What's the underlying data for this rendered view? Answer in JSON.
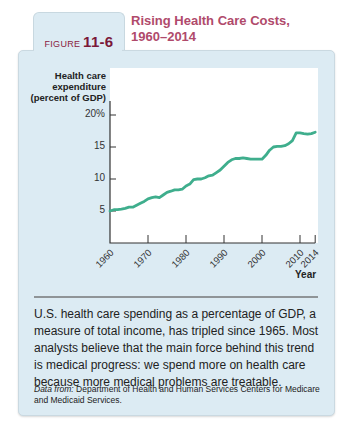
{
  "figure": {
    "tab_prefix": "FIGURE",
    "tab_number": "11-6",
    "title_line1": "Rising Health Care Costs,",
    "title_line2": "1960–2014"
  },
  "caption": "U.S. health care spending as a percentage of GDP, a measure of total income, has tripled since 1965. Most analysts believe that the main force behind this trend is medical progress: we spend more on health care because more medical problems are treatable.",
  "source": {
    "label": "Data from:",
    "text": "Department of Health and Human Services Centers for Medicare and Medicaid Services."
  },
  "colors": {
    "line": "#3fae8d",
    "title": "#b04a6b",
    "panel": "#dcebf3"
  },
  "chart_data": {
    "type": "line",
    "title": "Rising Health Care Costs, 1960–2014",
    "ylabel": "Health care expenditure (percent of GDP)",
    "ylabel_lines": [
      "Health care",
      "expenditure",
      "(percent of GDP)"
    ],
    "xlabel": "Year",
    "ylim": [
      0,
      20
    ],
    "xlim": [
      1960,
      2014
    ],
    "yticks": [
      5,
      10,
      15,
      20
    ],
    "ytick_labels": [
      "5",
      "10",
      "15",
      "20%"
    ],
    "xticks": [
      1960,
      1970,
      1980,
      1990,
      2000,
      2010,
      2014
    ],
    "xtick_labels": [
      "1960",
      "1970",
      "1980",
      "1990",
      "2000",
      "2010",
      "2014"
    ],
    "grid": false,
    "legend": null,
    "series": [
      {
        "name": "Health care expenditure",
        "x": [
          1960,
          1961,
          1962,
          1963,
          1964,
          1965,
          1966,
          1967,
          1968,
          1969,
          1970,
          1971,
          1972,
          1973,
          1974,
          1975,
          1976,
          1977,
          1978,
          1979,
          1980,
          1981,
          1982,
          1983,
          1984,
          1985,
          1986,
          1987,
          1988,
          1989,
          1990,
          1991,
          1992,
          1993,
          1994,
          1995,
          1996,
          1997,
          1998,
          1999,
          2000,
          2001,
          2002,
          2003,
          2004,
          2005,
          2006,
          2007,
          2008,
          2009,
          2010,
          2011,
          2012,
          2013,
          2014
        ],
        "values": [
          5.0,
          5.2,
          5.2,
          5.3,
          5.4,
          5.6,
          5.6,
          5.9,
          6.2,
          6.5,
          6.9,
          7.1,
          7.2,
          7.1,
          7.5,
          7.9,
          8.1,
          8.3,
          8.3,
          8.4,
          8.9,
          9.2,
          9.9,
          10.0,
          10.0,
          10.2,
          10.5,
          10.6,
          11.0,
          11.4,
          12.0,
          12.6,
          13.0,
          13.2,
          13.2,
          13.3,
          13.2,
          13.1,
          13.1,
          13.1,
          13.1,
          13.7,
          14.5,
          15.0,
          15.1,
          15.1,
          15.2,
          15.5,
          16.0,
          17.2,
          17.2,
          17.1,
          17.0,
          17.1,
          17.3
        ]
      }
    ]
  }
}
